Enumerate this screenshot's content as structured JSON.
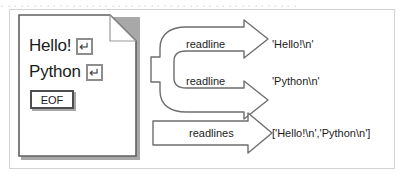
{
  "figure": {
    "top_remnant": "．．．．．．．．．．．．．．．．．．．．．．．．．．．．．．．．．．．．．．．．．．．．．．",
    "document": {
      "name": "text-file",
      "lines": [
        {
          "text": "Hello!",
          "terminator_icon": "return-icon",
          "terminator_glyph": "↵"
        },
        {
          "text": "Python",
          "terminator_icon": "return-icon",
          "terminator_glyph": "↵"
        }
      ],
      "eof_label": "EOF"
    },
    "flows": [
      {
        "id": "readline-1",
        "label": "readline",
        "output": "'Hello!\\n'"
      },
      {
        "id": "readline-2",
        "label": "readline",
        "output": "'Python\\n'"
      },
      {
        "id": "readlines",
        "label": "readlines",
        "output": "['Hello!\\n','Python\\n']"
      }
    ],
    "colors": {
      "frame_border": "#d2d2d2",
      "outline": "#6e6e6e",
      "shadow": "#a8a8a8",
      "text": "#1b1b1b",
      "return_box_border": "#8d8d8d",
      "eof_box_border": "#4e4e4e",
      "page_fill": "#ffffff"
    }
  }
}
